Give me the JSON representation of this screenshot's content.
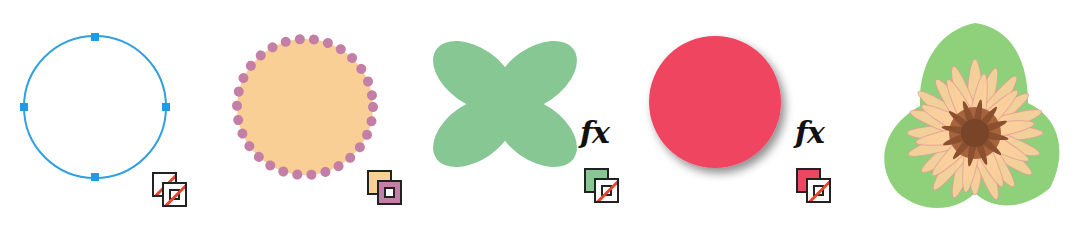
{
  "figure": {
    "panels": [
      {
        "id": "path-outline",
        "shape": "circle-path-with-anchor-points",
        "stroke_color": "#2fa0e0",
        "anchor_color": "#1e9be6",
        "fill": "none",
        "swatch": {
          "fill": "none",
          "stroke": "none"
        },
        "effects": false
      },
      {
        "id": "filled-dotted-circle",
        "shape": "circle-with-dotted-stroke",
        "fill_color": "#f9cf95",
        "stroke_color": "#c47fa6",
        "swatch": {
          "fill": "#f9cf95",
          "stroke": "#c47fa6"
        },
        "effects": false
      },
      {
        "id": "clover-shape",
        "shape": "four-petal-x",
        "fill_color": "#86c793",
        "swatch": {
          "fill": "#86c793",
          "stroke": "none"
        },
        "effects": true,
        "effects_label": "fx"
      },
      {
        "id": "shadowed-circle",
        "shape": "circle-with-drop-shadow",
        "fill_color": "#ef4560",
        "shadow_color": "#9a9a9a",
        "swatch": {
          "fill": "#ef4560",
          "stroke": "none"
        },
        "effects": true,
        "effects_label": "fx"
      },
      {
        "id": "flower-artwork",
        "shape": "flower-on-leaf",
        "leaf_color": "#8fd07a",
        "petal_color": "#fbcf9c",
        "petal_outline_color": "#e59a9a",
        "center_color": "#8a5030"
      }
    ],
    "none_slash_color": "#e8452c",
    "swatch_border_color": "#222222"
  }
}
